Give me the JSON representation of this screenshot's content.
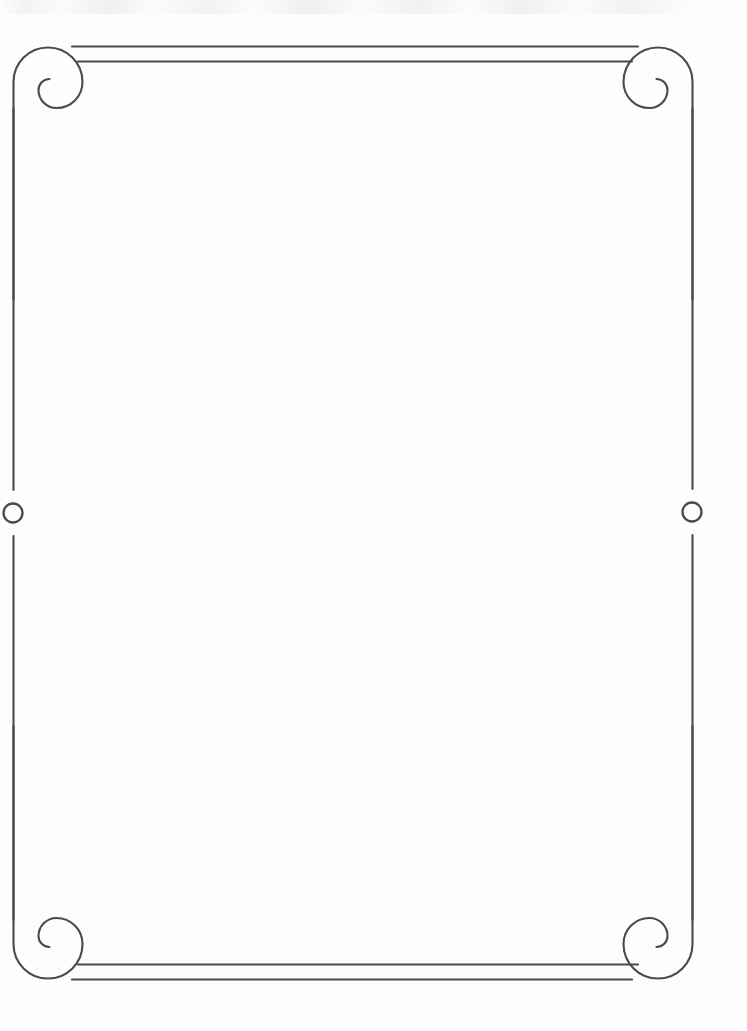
{
  "page": {
    "width": 747,
    "height": 1031,
    "background_color": "#fdfdfd",
    "ink_color": "#4a4a4d",
    "content_text": ""
  },
  "border": {
    "stroke_color": "#4a4a4d",
    "stroke_width": 2.1,
    "frame": {
      "left_x": 13,
      "right_x": 692,
      "top_y": 47,
      "bottom_y": 978
    },
    "corners": [
      {
        "name": "top-left-spiral",
        "cx": 48,
        "cy": 82
      },
      {
        "name": "top-right-spiral",
        "cx": 658,
        "cy": 82
      },
      {
        "name": "bottom-left-spiral",
        "cx": 48,
        "cy": 944
      },
      {
        "name": "bottom-right-spiral",
        "cx": 658,
        "cy": 944
      }
    ],
    "rules": {
      "top_outer": {
        "x1": 72,
        "y": 46,
        "x2": 638
      },
      "top_inner": {
        "x1": 78,
        "y": 61,
        "x2": 632
      },
      "bottom_outer": {
        "x1": 78,
        "y": 965,
        "x2": 638
      },
      "bottom_inner": {
        "x1": 72,
        "y": 979,
        "x2": 632
      }
    },
    "side_rules": {
      "left": {
        "x": 13,
        "y1": 100,
        "y2": 928
      },
      "right": {
        "x": 692,
        "y1": 100,
        "y2": 928
      }
    },
    "medallions": [
      {
        "name": "left-circle-ornament",
        "cx": 13,
        "cy": 513,
        "r": 9.5
      },
      {
        "name": "right-circle-ornament",
        "cx": 692,
        "cy": 512,
        "r": 9.5
      }
    ]
  }
}
